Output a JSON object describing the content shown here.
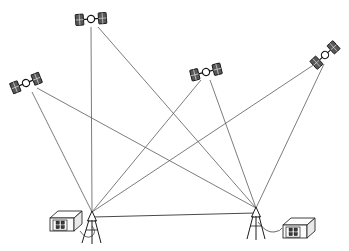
{
  "diagram": {
    "type": "technical-line-diagram",
    "background_color": "#ffffff",
    "line_color": "#5a5a5a",
    "ink_color": "#141414",
    "panel_color": "#58585a",
    "width": 349,
    "height": 251
  },
  "satellites": [
    {
      "id": "satellite-1",
      "label": "",
      "icon": "gps-satellite-icon",
      "x": 26,
      "y": 83,
      "rotation": -22
    },
    {
      "id": "satellite-2",
      "label": "",
      "icon": "gps-satellite-icon",
      "x": 91,
      "y": 19,
      "rotation": -4
    },
    {
      "id": "satellite-3",
      "label": "",
      "icon": "gps-satellite-icon",
      "x": 206,
      "y": 72,
      "rotation": -14
    },
    {
      "id": "satellite-4",
      "label": "",
      "icon": "gps-satellite-icon",
      "x": 325,
      "y": 55,
      "rotation": -42
    }
  ],
  "ground_stations": [
    {
      "id": "station-left",
      "label": "",
      "antenna_icon": "tripod-antenna-icon",
      "receiver_icon": "gps-receiver-box-icon",
      "antenna_x": 92,
      "antenna_y": 212,
      "receiver_x": 63,
      "receiver_y": 224,
      "receiver_buttons": 4
    },
    {
      "id": "station-right",
      "label": "",
      "antenna_icon": "tripod-antenna-icon",
      "receiver_icon": "gps-receiver-box-icon",
      "antenna_x": 256,
      "antenna_y": 208,
      "receiver_x": 296,
      "receiver_y": 231,
      "receiver_buttons": 4
    }
  ],
  "signal_paths": [
    {
      "from": "satellite-1",
      "to": "station-left"
    },
    {
      "from": "satellite-1",
      "to": "station-right"
    },
    {
      "from": "satellite-2",
      "to": "station-left"
    },
    {
      "from": "satellite-2",
      "to": "station-right"
    },
    {
      "from": "satellite-3",
      "to": "station-left"
    },
    {
      "from": "satellite-3",
      "to": "station-right"
    },
    {
      "from": "satellite-4",
      "to": "station-left"
    },
    {
      "from": "satellite-4",
      "to": "station-right"
    }
  ],
  "baseline": {
    "label": "",
    "from": "station-left",
    "to": "station-right"
  }
}
